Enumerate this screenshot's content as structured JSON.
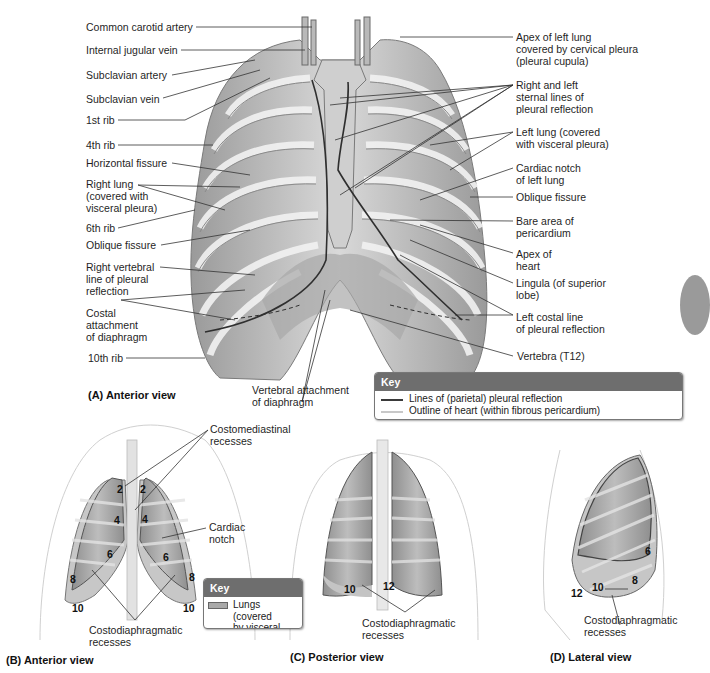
{
  "figure": {
    "panel_a": {
      "title": "(A) Anterior view",
      "left_labels": [
        "Common carotid artery",
        "Internal jugular vein",
        "Subclavian artery",
        "Subclavian vein",
        "1st rib",
        "4th rib",
        "Horizontal fissure",
        "Right lung\n(covered with\nvisceral pleura)",
        "6th rib",
        "Oblique fissure",
        "Right vertebral\nline of pleural\nreflection",
        "Costal\nattachment\nof diaphragm",
        "10th rib"
      ],
      "right_labels": [
        "Apex of left lung\ncovered by cervical pleura\n(pleural cupula)",
        "Right and left\nsternal lines of\npleural  reflection",
        "Left lung (covered\nwith visceral pleura)",
        "Cardiac notch\nof left lung",
        "Oblique fissure",
        "Bare area of\npericardium",
        "Apex of\nheart",
        "Lingula (of superior\nlobe)",
        "Left costal line\nof pleural reflection",
        "Vertebra (T12)"
      ],
      "bottom_label": "Vertebral attachment\nof diaphragm",
      "key": {
        "heading": "Key",
        "items": [
          {
            "label": "Lines of (parietal) pleural reflection",
            "color": "#3a3a3a"
          },
          {
            "label": "Outline of heart (within fibrous pericardium)",
            "color": "#c8c8c8"
          }
        ]
      }
    },
    "panel_b": {
      "title": "(B) Anterior view",
      "labels": {
        "costomediastinal": "Costomediastinal\nrecesses",
        "cardiac_notch": "Cardiac\nnotch",
        "costodiaphragmatic": "Costodiaphragmatic\nrecesses"
      },
      "rib_numbers": [
        "2",
        "2",
        "4",
        "4",
        "6",
        "6",
        "8",
        "8",
        "10",
        "10"
      ],
      "key": {
        "heading": "Key",
        "items": [
          {
            "label": "Lungs (covered\nby visceral pleura)",
            "color": "#a9a9a9"
          },
          {
            "label": "Parietal pleura",
            "color": "#8c8c8c"
          }
        ]
      }
    },
    "panel_c": {
      "title": "(C) Posterior view",
      "labels": {
        "costodiaphragmatic": "Costodiaphragmatic\nrecesses"
      },
      "rib_numbers": [
        "10",
        "12"
      ]
    },
    "panel_d": {
      "title": "(D) Lateral view",
      "labels": {
        "costodiaphragmatic": "Costodiaphragmatic\nrecesses"
      },
      "rib_numbers": [
        "6",
        "8",
        "10",
        "12"
      ]
    }
  },
  "colors": {
    "key_header": "#6e6e6e",
    "leader_line": "#333333",
    "lung_fill": "#9e9e9e",
    "rib_fill": "#e6e6e6",
    "parietal_fill": "#c4c4c4"
  }
}
